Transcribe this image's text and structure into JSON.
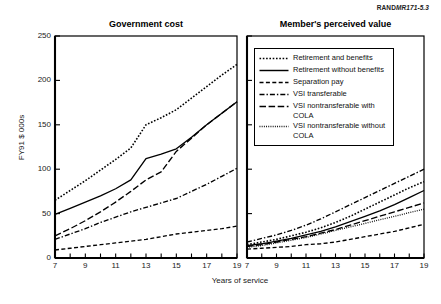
{
  "figure": {
    "source_tag": {
      "prefix": "RAND",
      "suffix": "MR171-5.3"
    },
    "xlabel": "Years of service",
    "ylabel": "FY91 $ 000s"
  },
  "legend": {
    "items": [
      {
        "label": "Retirement and benefits",
        "style": "dotted-coarse",
        "key": "retirement-and-benefits"
      },
      {
        "label": "Retirement without benefits",
        "style": "solid",
        "key": "retirement-without-benefits"
      },
      {
        "label": "Separation pay",
        "style": "dashed",
        "key": "separation-pay"
      },
      {
        "label": "VSI transferable",
        "style": "dash-dot",
        "key": "vsi-transferable"
      },
      {
        "label": "VSI nontransferable with COLA",
        "style": "long-dash",
        "key": "vsi-nontransferable-with-cola"
      },
      {
        "label": "VSI nontransferable without COLA",
        "style": "dotted-fine",
        "key": "vsi-nontransferable-without-cola"
      }
    ]
  },
  "chart_data": [
    {
      "type": "line",
      "title": "Government cost",
      "xlabel": "Years of service",
      "ylabel": "FY91 $ 000s",
      "xlim": [
        7,
        19
      ],
      "ylim": [
        0,
        250
      ],
      "xticks": [
        7,
        8,
        9,
        10,
        11,
        12,
        13,
        14,
        15,
        16,
        17,
        18,
        19
      ],
      "xticklabels": [
        "7",
        "",
        "9",
        "",
        "11",
        "",
        "13",
        "",
        "15",
        "",
        "17",
        "",
        "19"
      ],
      "yticks": [
        0,
        50,
        100,
        150,
        200,
        250
      ],
      "yticklabels": [
        "0",
        "50",
        "100",
        "150",
        "200",
        "250"
      ],
      "grid": false,
      "legend_position": "right-panel",
      "x": [
        7,
        8,
        9,
        10,
        11,
        12,
        13,
        14,
        15,
        16,
        17,
        18,
        19
      ],
      "series": [
        {
          "name": "Retirement and benefits",
          "style": "dotted-coarse",
          "values": [
            65,
            76,
            87,
            99,
            111,
            124,
            150,
            158,
            167,
            180,
            193,
            206,
            218
          ]
        },
        {
          "name": "Retirement without benefits",
          "style": "solid",
          "values": [
            49,
            56,
            63,
            70,
            78,
            88,
            112,
            117,
            123,
            136,
            150,
            163,
            176
          ]
        },
        {
          "name": "Separation pay",
          "style": "dashed",
          "values": [
            9,
            11,
            13,
            15,
            17,
            19,
            21,
            24,
            27,
            29,
            31,
            33,
            36
          ]
        },
        {
          "name": "VSI transferable",
          "style": "dash-dot",
          "values": [
            21,
            27,
            33,
            40,
            46,
            52,
            57,
            62,
            67,
            75,
            83,
            92,
            101
          ]
        },
        {
          "name": "VSI nontransferable with COLA",
          "style": "long-dash",
          "values": [
            25,
            33,
            42,
            52,
            63,
            75,
            88,
            97,
            120,
            135,
            150,
            163,
            176
          ]
        }
      ]
    },
    {
      "type": "line",
      "title": "Member's perceived value",
      "xlabel": "Years of service",
      "ylabel": "FY91 $ 000s",
      "xlim": [
        7,
        19
      ],
      "ylim": [
        0,
        250
      ],
      "xticks": [
        7,
        8,
        9,
        10,
        11,
        12,
        13,
        14,
        15,
        16,
        17,
        18,
        19
      ],
      "xticklabels": [
        "7",
        "",
        "9",
        "",
        "11",
        "",
        "13",
        "",
        "15",
        "",
        "17",
        "",
        "19"
      ],
      "yticks": [
        0,
        50,
        100,
        150,
        200,
        250
      ],
      "yticklabels": [
        "",
        "",
        "",
        "",
        "",
        ""
      ],
      "grid": false,
      "legend_position": "inside-top",
      "x": [
        7,
        8,
        9,
        10,
        11,
        12,
        13,
        14,
        15,
        16,
        17,
        18,
        19
      ],
      "series": [
        {
          "name": "Retirement and benefits",
          "style": "dotted-coarse",
          "values": [
            15,
            18,
            21,
            25,
            29,
            34,
            40,
            47,
            55,
            63,
            71,
            79,
            86
          ]
        },
        {
          "name": "Retirement without benefits",
          "style": "solid",
          "values": [
            14,
            16,
            19,
            22,
            26,
            30,
            35,
            41,
            47,
            53,
            60,
            68,
            76
          ]
        },
        {
          "name": "Separation pay",
          "style": "dashed",
          "values": [
            10,
            11,
            12,
            13,
            15,
            16,
            18,
            21,
            24,
            27,
            30,
            34,
            38
          ]
        },
        {
          "name": "VSI transferable",
          "style": "dash-dot",
          "values": [
            18,
            22,
            26,
            31,
            37,
            44,
            52,
            60,
            68,
            76,
            84,
            92,
            100
          ]
        },
        {
          "name": "VSI nontransferable with COLA",
          "style": "long-dash",
          "values": [
            13,
            15,
            18,
            21,
            24,
            28,
            32,
            37,
            42,
            47,
            52,
            57,
            62
          ]
        },
        {
          "name": "VSI nontransferable without COLA",
          "style": "dotted-fine",
          "values": [
            12,
            14,
            17,
            20,
            23,
            27,
            31,
            35,
            39,
            43,
            47,
            51,
            55
          ]
        }
      ]
    }
  ]
}
